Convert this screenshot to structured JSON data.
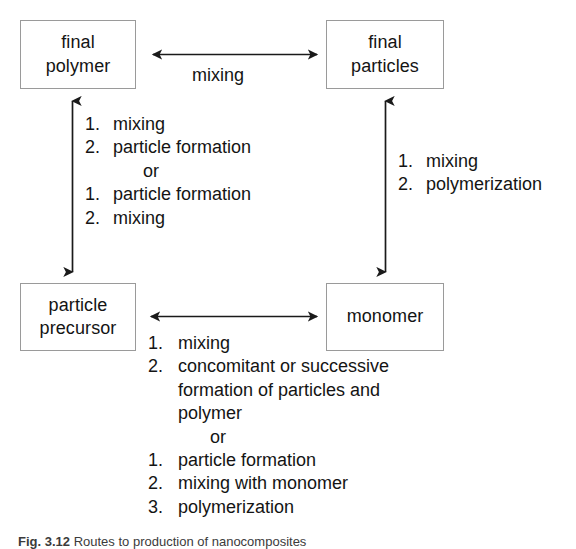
{
  "figure": {
    "caption_label": "Fig. 3.12",
    "caption_text": "Routes to production of nanocomposites"
  },
  "nodes": {
    "final_polymer": "final\npolymer",
    "final_particles": "final\nparticles",
    "particle_precursor": "particle\nprecursor",
    "monomer": "monomer"
  },
  "edges": {
    "top_horizontal_label": "mixing"
  },
  "left_route": {
    "option_a": [
      {
        "num": "1.",
        "text": "mixing"
      },
      {
        "num": "2.",
        "text": "particle formation"
      }
    ],
    "or": "or",
    "option_b": [
      {
        "num": "1.",
        "text": "particle formation"
      },
      {
        "num": "2.",
        "text": "mixing"
      }
    ]
  },
  "right_route": {
    "steps": [
      {
        "num": "1.",
        "text": "mixing"
      },
      {
        "num": "2.",
        "text": "polymerization"
      }
    ]
  },
  "bottom_route": {
    "option_a": [
      {
        "num": "1.",
        "text": "mixing"
      },
      {
        "num": "2.",
        "text": "concomitant or successive\nformation of particles and\npolymer"
      }
    ],
    "or": "or",
    "option_b": [
      {
        "num": "1.",
        "text": "particle formation"
      },
      {
        "num": "2.",
        "text": "mixing with monomer"
      },
      {
        "num": "3.",
        "text": "polymerization"
      }
    ]
  },
  "colors": {
    "box_border": "#9a9a9a",
    "text": "#141414",
    "arrow": "#1a1a1a",
    "background": "#ffffff"
  }
}
